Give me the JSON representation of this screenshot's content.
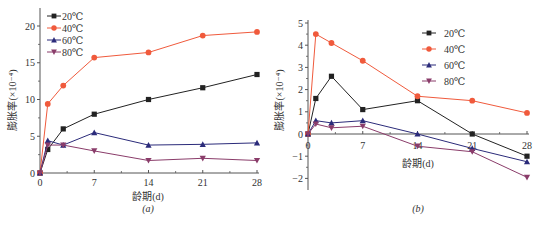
{
  "chart_data": [
    {
      "id": "a",
      "type": "line",
      "caption": "(a)",
      "title": "",
      "xlabel": "龄期(d)",
      "ylabel": "膨胀率(×10⁻⁴)",
      "x": [
        0,
        1,
        3,
        7,
        14,
        21,
        28
      ],
      "xticks": [
        0,
        7,
        14,
        21,
        28
      ],
      "yticks": [
        0,
        5,
        10,
        15,
        20
      ],
      "xlim": [
        0,
        28
      ],
      "ylim": [
        0,
        22
      ],
      "legend_position": "upper-left",
      "series": [
        {
          "name": "20℃",
          "color": "#222222",
          "marker": "square",
          "values": [
            0,
            3.2,
            6.0,
            8.0,
            10.0,
            11.6,
            13.4
          ]
        },
        {
          "name": "40℃",
          "color": "#f05a3c",
          "marker": "circle",
          "values": [
            0,
            9.4,
            11.9,
            15.7,
            16.4,
            18.7,
            19.2
          ]
        },
        {
          "name": "60℃",
          "color": "#2b2b7a",
          "marker": "triangle-up",
          "values": [
            0,
            4.4,
            3.8,
            5.5,
            3.8,
            3.9,
            4.1
          ]
        },
        {
          "name": "80℃",
          "color": "#8a3c6a",
          "marker": "triangle-down",
          "values": [
            0,
            3.8,
            3.8,
            3.0,
            1.7,
            2.0,
            1.7
          ]
        }
      ]
    },
    {
      "id": "b",
      "type": "line",
      "caption": "(b)",
      "title": "",
      "xlabel": "龄期(d)",
      "ylabel": "膨胀率(×10⁻⁴)",
      "x": [
        0,
        1,
        3,
        7,
        14,
        21,
        28
      ],
      "xticks": [
        0,
        7,
        14,
        21,
        28
      ],
      "yticks": [
        -2,
        -1,
        0,
        1,
        2,
        3,
        4,
        5
      ],
      "xlim": [
        0,
        28
      ],
      "ylim": [
        -2.5,
        5
      ],
      "legend_position": "upper-right",
      "series": [
        {
          "name": "20℃",
          "color": "#222222",
          "marker": "square",
          "values": [
            0,
            1.6,
            2.6,
            1.1,
            1.5,
            0,
            -1.0
          ]
        },
        {
          "name": "40℃",
          "color": "#f05a3c",
          "marker": "circle",
          "values": [
            0,
            4.5,
            4.1,
            3.3,
            1.7,
            1.5,
            0.95
          ]
        },
        {
          "name": "60℃",
          "color": "#2b2b7a",
          "marker": "triangle-up",
          "values": [
            0,
            0.6,
            0.5,
            0.6,
            0,
            -0.65,
            -1.25
          ]
        },
        {
          "name": "80℃",
          "color": "#8a3c6a",
          "marker": "triangle-down",
          "values": [
            0,
            0.45,
            0.28,
            0.35,
            -0.55,
            -0.8,
            -1.95
          ]
        }
      ]
    }
  ]
}
